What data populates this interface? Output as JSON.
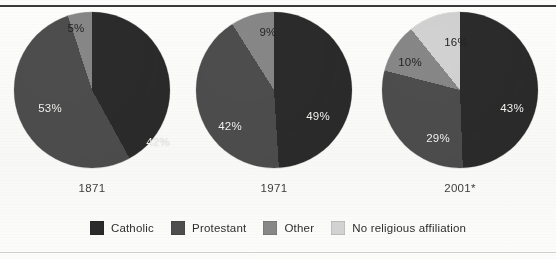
{
  "figure": {
    "top_rule": true,
    "bottom_rule": true
  },
  "colors": {
    "catholic": "#2b2b2b",
    "protestant": "#4d4d4d",
    "other": "#878787",
    "no_religious_affiliation": "#d2d2d2",
    "label_on_dark": "#f2f2f0",
    "label_on_light": "#242424",
    "rule": "#3a3a3a",
    "paper": "#fbfbfa"
  },
  "legend": {
    "items": [
      {
        "label": "Catholic",
        "color": "#2b2b2b",
        "swatch_name": "legend-swatch-catholic"
      },
      {
        "label": "Protestant",
        "color": "#4d4d4d",
        "swatch_name": "legend-swatch-protestant"
      },
      {
        "label": "Other",
        "color": "#878787",
        "swatch_name": "legend-swatch-other"
      },
      {
        "label": "No religious affiliation",
        "color": "#d2d2d2",
        "swatch_name": "legend-swatch-no-religious-affiliation"
      }
    ]
  },
  "chart_data": {
    "type": "pie",
    "title": "",
    "subtitle": "",
    "xlabel": "",
    "ylabel": "",
    "legend_position": "bottom",
    "grid": false,
    "value_suffix": "%",
    "categories": [
      "Catholic",
      "Protestant",
      "Other",
      "No religious affiliation"
    ],
    "category_colors": [
      "#2b2b2b",
      "#4d4d4d",
      "#878787",
      "#d2d2d2"
    ],
    "charts": [
      {
        "year_label": "1871",
        "start_angle_deg": 0,
        "slices": [
          {
            "category": "Catholic",
            "value": 42,
            "label": "42%",
            "color": "#2b2b2b",
            "label_on_dark": true,
            "lx": 66,
            "ly": 52
          },
          {
            "category": "Protestant",
            "value": 53,
            "label": "53%",
            "color": "#4d4d4d",
            "label_on_dark": true,
            "lx": -42,
            "ly": 18
          },
          {
            "category": "Other",
            "value": 5,
            "label": "5%",
            "color": "#878787",
            "label_on_dark": false,
            "lx": -16,
            "ly": -62
          }
        ]
      },
      {
        "year_label": "1971",
        "start_angle_deg": 0,
        "slices": [
          {
            "category": "Catholic",
            "value": 49,
            "label": "49%",
            "color": "#2b2b2b",
            "label_on_dark": true,
            "lx": 44,
            "ly": 26
          },
          {
            "category": "Protestant",
            "value": 42,
            "label": "42%",
            "color": "#4d4d4d",
            "label_on_dark": true,
            "lx": -44,
            "ly": 36
          },
          {
            "category": "Other",
            "value": 9,
            "label": "9%",
            "color": "#878787",
            "label_on_dark": false,
            "lx": -6,
            "ly": -58
          }
        ]
      },
      {
        "year_label": "2001*",
        "start_angle_deg": 20,
        "slices": [
          {
            "category": "Catholic",
            "value": 43,
            "label": "43%",
            "color": "#2b2b2b",
            "label_on_dark": true,
            "lx": 52,
            "ly": 18
          },
          {
            "category": "Protestant",
            "value": 29,
            "label": "29%",
            "color": "#4d4d4d",
            "label_on_dark": true,
            "lx": -22,
            "ly": 48
          },
          {
            "category": "Other",
            "value": 10,
            "label": "10%",
            "color": "#878787",
            "label_on_dark": false,
            "lx": -50,
            "ly": -28
          },
          {
            "category": "No religious affiliation",
            "value": 16,
            "label": "16%",
            "color": "#d2d2d2",
            "label_on_dark": false,
            "lx": -4,
            "ly": -48
          }
        ]
      }
    ]
  }
}
